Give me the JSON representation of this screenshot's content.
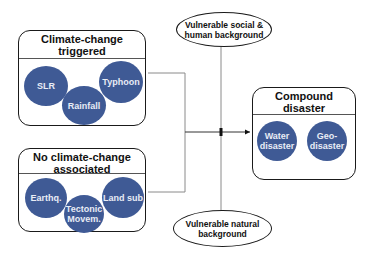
{
  "diagram": {
    "groups": [
      {
        "id": "climate-change-triggered",
        "title": "Climate-change triggered",
        "items": [
          "SLR",
          "Rainfall",
          "Typhoon"
        ]
      },
      {
        "id": "no-climate-change-associated",
        "title": "No climate-change associated",
        "items": [
          "Earthq.",
          "Tectonic\nMovem.",
          "Land sub"
        ]
      },
      {
        "id": "compound-disaster",
        "title": "Compound disaster",
        "items": [
          "Water\ndisaster",
          "Geo-\ndisaster"
        ]
      }
    ],
    "modifiers": {
      "top": "Vulnerable social &\nhuman background",
      "bottom": "Vulnerable natural\nbackground"
    },
    "colors": {
      "circle_fill": "#3f5a95",
      "circle_text": "#e8ecf5",
      "line": "#8a8a8a",
      "border": "#1a1a1a"
    }
  }
}
